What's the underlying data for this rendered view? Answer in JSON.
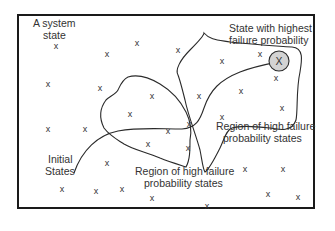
{
  "diagram": {
    "labels": {
      "system_state": [
        "A system",
        "state"
      ],
      "highest_state": [
        "State with highest",
        "failure probability"
      ],
      "region_right": [
        "Region of high failure",
        "probability states"
      ],
      "region_bottom": [
        "Region of high failure",
        "probability states"
      ],
      "initial": [
        "Initial",
        "States"
      ]
    },
    "state_marker": "x",
    "highest_marker": "X",
    "colors": {
      "highest_fill": "#d3d3d3",
      "line": "#2a2a2a"
    }
  }
}
